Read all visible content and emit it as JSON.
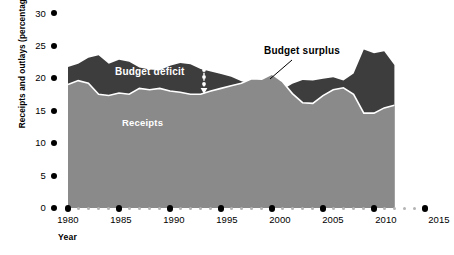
{
  "chart_data": {
    "type": "area",
    "title": "",
    "xlabel": "Year",
    "ylabel": "Receipts and outlays (percentage of GDP)",
    "xlim": [
      1980,
      2015
    ],
    "ylim": [
      0,
      30
    ],
    "xticks": [
      1980,
      1985,
      1990,
      1995,
      2000,
      2005,
      2010,
      2015
    ],
    "yticks": [
      0,
      5,
      10,
      15,
      20,
      25,
      30
    ],
    "grid": false,
    "legend_position": "inline-annotations",
    "x": [
      1980,
      1981,
      1982,
      1983,
      1984,
      1985,
      1986,
      1987,
      1988,
      1989,
      1990,
      1991,
      1992,
      1993,
      1994,
      1995,
      1996,
      1997,
      1998,
      1999,
      2000,
      2001,
      2002,
      2003,
      2004,
      2005,
      2006,
      2007,
      2008,
      2009,
      2010,
      2011,
      2012
    ],
    "series": [
      {
        "name": "Outlays",
        "color": "#3d3d3d",
        "values": [
          21.7,
          22.2,
          23.1,
          23.5,
          22.2,
          22.8,
          22.5,
          21.6,
          21.3,
          21.2,
          21.9,
          22.3,
          22.1,
          21.4,
          21.0,
          20.6,
          20.2,
          19.5,
          19.1,
          18.5,
          18.2,
          18.2,
          19.1,
          19.7,
          19.6,
          19.9,
          20.1,
          19.6,
          20.7,
          24.4,
          23.8,
          24.1,
          22.0
        ]
      },
      {
        "name": "Receipts",
        "color": "#8a8a8a",
        "values": [
          19.0,
          19.6,
          19.2,
          17.5,
          17.3,
          17.7,
          17.5,
          18.4,
          18.2,
          18.4,
          18.0,
          17.8,
          17.5,
          17.5,
          18.0,
          18.4,
          18.8,
          19.2,
          19.9,
          19.8,
          20.6,
          19.5,
          17.6,
          16.2,
          16.1,
          17.3,
          18.2,
          18.5,
          17.5,
          14.6,
          14.6,
          15.4,
          15.8
        ]
      }
    ],
    "annotations": [
      {
        "name": "outlays",
        "text": "Outlays"
      },
      {
        "name": "budget-deficit",
        "text": "Budget deficit"
      },
      {
        "name": "receipts",
        "text": "Receipts"
      },
      {
        "name": "budget-surplus",
        "text": "Budget surplus"
      }
    ],
    "colors": {
      "outlays_fill": "#3d3d3d",
      "receipts_fill": "#8a8a8a",
      "boundary_line": "#ffffff",
      "axis_tick": "#000000",
      "minor_tick": "#b4b4b4",
      "background": "#ffffff"
    }
  },
  "axes": {
    "y_title": "Receipts and outlays (percentage of GDP)",
    "x_title": "Year",
    "y_tick_labels": [
      "30",
      "25",
      "20",
      "15",
      "10",
      "5",
      "0"
    ],
    "x_tick_labels": [
      "1980",
      "1985",
      "1990",
      "1995",
      "2000",
      "2005",
      "2010",
      "2015"
    ]
  },
  "labels": {
    "outlays": "Outlays",
    "budget_deficit": "Budget deficit",
    "receipts": "Receipts",
    "budget_surplus": "Budget surplus"
  }
}
